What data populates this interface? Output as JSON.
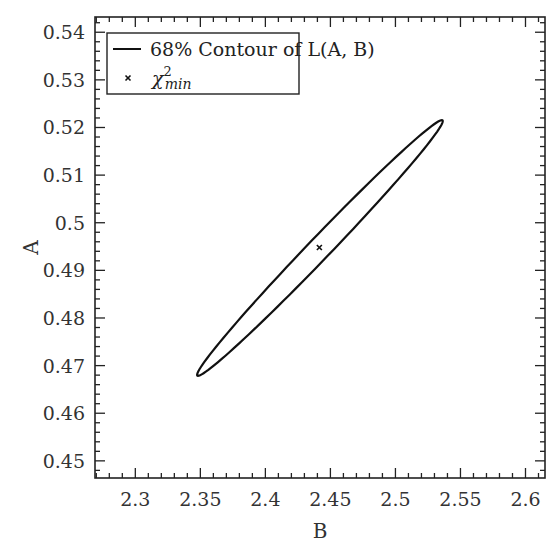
{
  "chart_data": {
    "type": "line",
    "title": "",
    "xlabel": "B",
    "ylabel": "A",
    "xlim": [
      2.269,
      2.615
    ],
    "ylim": [
      0.4464,
      0.5432
    ],
    "xticks": [
      2.3,
      2.35,
      2.4,
      2.45,
      2.5,
      2.55,
      2.6
    ],
    "xtick_labels": [
      "2.3",
      "2.35",
      "2.4",
      "2.45",
      "2.5",
      "2.55",
      "2.6"
    ],
    "yticks": [
      0.45,
      0.46,
      0.47,
      0.48,
      0.49,
      0.5,
      0.51,
      0.52,
      0.53,
      0.54
    ],
    "ytick_labels": [
      "0.45",
      "0.46",
      "0.47",
      "0.48",
      "0.49",
      "0.5",
      "0.51",
      "0.52",
      "0.53",
      "0.54"
    ],
    "grid": false,
    "legend_position": "upper left",
    "legend": [
      {
        "label": "68% Contour of L(A, B)",
        "marker": "line"
      },
      {
        "label_base": "χ",
        "label_sup": "2",
        "label_sub": "min",
        "marker": "x"
      }
    ],
    "series": [
      {
        "name": "68% Contour of L(A, B)",
        "kind": "ellipse",
        "center": {
          "B": 2.4415,
          "A": 0.4948
        },
        "tip_low": {
          "B": 2.3477,
          "A": 0.4679
        },
        "tip_high": {
          "B": 2.5362,
          "A": 0.5215
        },
        "half_width_px": 11
      },
      {
        "name": "chi2_min",
        "kind": "point",
        "x": [
          2.4415
        ],
        "y": [
          0.4948
        ]
      }
    ]
  },
  "plot": {
    "corner_label": "(·)"
  }
}
